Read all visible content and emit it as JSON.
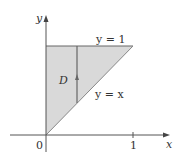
{
  "diagram": {
    "axis_x_label": "x",
    "axis_y_label": "y",
    "origin_label": "0",
    "tick_x_label": "1",
    "region_label": "D",
    "top_line_label": "y = 1",
    "diagonal_line_label": "y = x",
    "region_fill": "#d9d9d9",
    "line_color": "#555555"
  }
}
